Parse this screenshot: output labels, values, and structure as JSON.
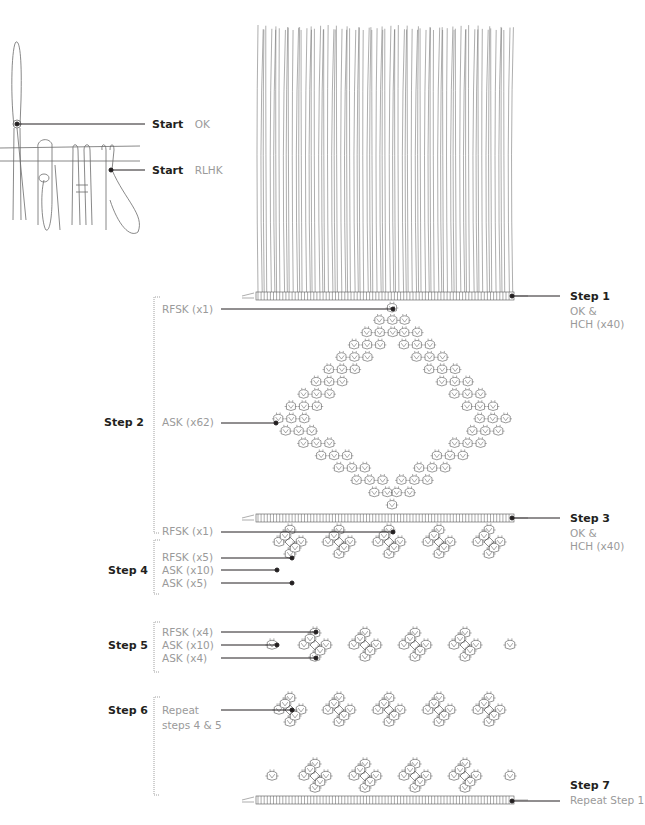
{
  "diagram": {
    "colors": {
      "ink": "#231f20",
      "cord": "#6b6b6b",
      "label_gray": "#9a9a9a",
      "bracket": "#a0a0a0"
    },
    "start_callouts": [
      {
        "step": "Start",
        "knot": "OK"
      },
      {
        "step": "Start",
        "knot": "RLHK"
      }
    ],
    "steps": [
      {
        "id": "step1",
        "label": "Step 1",
        "note_lines": [
          "OK &",
          "HCH (x40)"
        ]
      },
      {
        "id": "step2",
        "label": "Step 2",
        "callouts": [
          "RFSK (x1)",
          "ASK (x62)",
          "RFSK (x1)"
        ]
      },
      {
        "id": "step3",
        "label": "Step 3",
        "note_lines": [
          "OK &",
          "HCH (x40)"
        ]
      },
      {
        "id": "step4",
        "label": "Step 4",
        "callouts": [
          "RFSK (x5)",
          "ASK (x10)",
          "ASK (x5)"
        ]
      },
      {
        "id": "step5",
        "label": "Step 5",
        "callouts": [
          "RFSK (x4)",
          "ASK (x10)",
          "ASK (x4)"
        ]
      },
      {
        "id": "step6",
        "label": "Step 6",
        "note_lines": [
          "Repeat",
          "steps 4 & 5"
        ]
      },
      {
        "id": "step7",
        "label": "Step 7",
        "note_lines": [
          "Repeat Step 1"
        ]
      }
    ],
    "structure": {
      "cord_count": 80,
      "hch_rows": [
        {
          "y": 296,
          "x1": 242,
          "x2": 530
        },
        {
          "y": 518,
          "x1": 242,
          "x2": 530
        },
        {
          "y": 800,
          "x1": 242,
          "x2": 530
        }
      ],
      "diamond": {
        "cx": 392,
        "top": 308,
        "mid": 423,
        "bottom": 505,
        "half_width": 118
      },
      "cluster_rows": [
        {
          "y": 542,
          "xs": [
            290,
            339,
            389,
            439,
            489
          ],
          "singles": []
        },
        {
          "y": 645,
          "xs": [
            315,
            365,
            415,
            465
          ],
          "singles": [
            272,
            510
          ]
        },
        {
          "y": 710,
          "xs": [
            290,
            339,
            389,
            439,
            489
          ],
          "singles": []
        },
        {
          "y": 776,
          "xs": [
            315,
            365,
            415,
            465
          ],
          "singles": [
            272,
            510
          ]
        }
      ]
    }
  }
}
